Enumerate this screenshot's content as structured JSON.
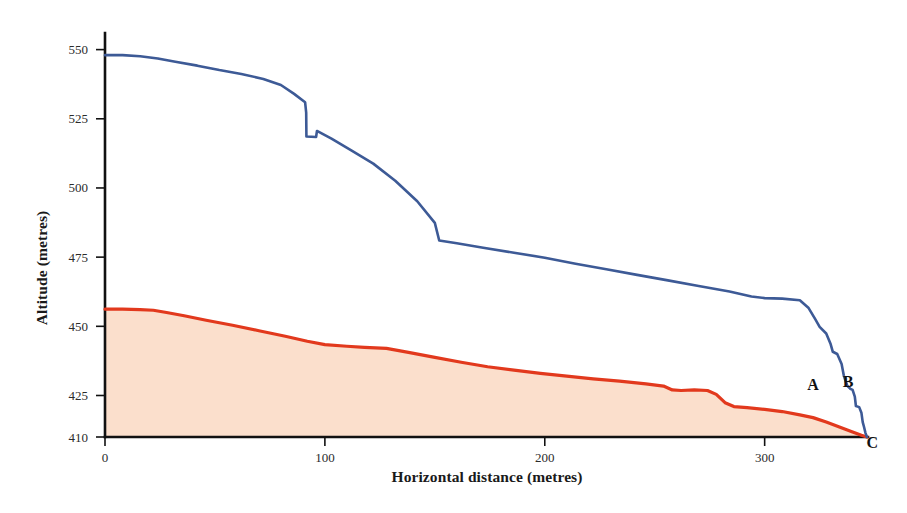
{
  "chart_data": {
    "type": "line",
    "title": "",
    "xlabel": "Horizontal distance (metres)",
    "ylabel": "Altitude (metres)",
    "xlim": [
      0,
      347
    ],
    "ylim": [
      410,
      556
    ],
    "xticks": [
      0,
      100,
      200,
      300
    ],
    "xticklabels": [
      "0",
      "100",
      "200",
      "300"
    ],
    "yticks": [
      410,
      425,
      450,
      475,
      500,
      525,
      550
    ],
    "yticklabels": [
      "410",
      "425",
      "450",
      "475",
      "500",
      "525",
      "550"
    ],
    "grid": false,
    "legend": "none",
    "series": [
      {
        "name": "upper-profile",
        "color": "#3d5a96",
        "fill": "none",
        "points": [
          [
            0,
            548.0
          ],
          [
            8,
            548.0
          ],
          [
            16,
            547.6
          ],
          [
            24,
            546.8
          ],
          [
            32,
            545.6
          ],
          [
            42,
            544.2
          ],
          [
            52,
            542.6
          ],
          [
            62,
            541.2
          ],
          [
            72,
            539.4
          ],
          [
            80,
            537.2
          ],
          [
            86,
            534.0
          ],
          [
            91,
            531.0
          ],
          [
            91.5,
            527.2
          ],
          [
            91.6,
            518.6
          ],
          [
            96,
            518.4
          ],
          [
            96.4,
            520.6
          ],
          [
            103,
            517.8
          ],
          [
            112,
            513.6
          ],
          [
            122,
            508.8
          ],
          [
            132,
            502.6
          ],
          [
            142,
            495.2
          ],
          [
            150,
            487.4
          ],
          [
            152,
            481.0
          ],
          [
            160,
            480.0
          ],
          [
            172,
            478.4
          ],
          [
            186,
            476.6
          ],
          [
            200,
            474.8
          ],
          [
            214,
            472.6
          ],
          [
            228,
            470.6
          ],
          [
            242,
            468.6
          ],
          [
            256,
            466.6
          ],
          [
            270,
            464.6
          ],
          [
            284,
            462.6
          ],
          [
            294,
            460.8
          ],
          [
            300,
            460.2
          ],
          [
            308,
            460.0
          ],
          [
            316,
            459.4
          ],
          [
            320,
            456.6
          ],
          [
            323,
            452.6
          ],
          [
            325,
            449.8
          ],
          [
            328,
            447.4
          ],
          [
            330,
            443.6
          ],
          [
            331,
            440.8
          ],
          [
            333,
            440.0
          ],
          [
            335,
            436.4
          ],
          [
            336,
            432.2
          ],
          [
            337.5,
            428.6
          ],
          [
            339,
            427.4
          ],
          [
            340,
            427.0
          ],
          [
            341,
            424.6
          ],
          [
            341.5,
            421.2
          ],
          [
            343,
            420.8
          ],
          [
            344,
            418.8
          ],
          [
            344.6,
            415.4
          ],
          [
            345.2,
            413.6
          ],
          [
            345.8,
            411.6
          ],
          [
            346.5,
            410.0
          ]
        ]
      },
      {
        "name": "lower-profile",
        "color": "#e2391d",
        "fill": "#fbdfcc",
        "points": [
          [
            0,
            456.2
          ],
          [
            8,
            456.2
          ],
          [
            16,
            456.0
          ],
          [
            22,
            455.8
          ],
          [
            28,
            455.0
          ],
          [
            36,
            453.8
          ],
          [
            46,
            452.2
          ],
          [
            58,
            450.4
          ],
          [
            70,
            448.4
          ],
          [
            82,
            446.4
          ],
          [
            92,
            444.6
          ],
          [
            100,
            443.4
          ],
          [
            110,
            442.8
          ],
          [
            118,
            442.4
          ],
          [
            128,
            442.0
          ],
          [
            138,
            440.6
          ],
          [
            150,
            438.8
          ],
          [
            162,
            437.0
          ],
          [
            174,
            435.4
          ],
          [
            186,
            434.2
          ],
          [
            198,
            433.0
          ],
          [
            210,
            432.0
          ],
          [
            222,
            431.0
          ],
          [
            234,
            430.2
          ],
          [
            246,
            429.2
          ],
          [
            254,
            428.4
          ],
          [
            258,
            427.0
          ],
          [
            262,
            426.8
          ],
          [
            268,
            427.0
          ],
          [
            274,
            426.8
          ],
          [
            278,
            425.4
          ],
          [
            282,
            422.4
          ],
          [
            286,
            421.0
          ],
          [
            292,
            420.6
          ],
          [
            300,
            420.0
          ],
          [
            308,
            419.2
          ],
          [
            316,
            418.0
          ],
          [
            322,
            417.0
          ],
          [
            328,
            415.4
          ],
          [
            334,
            413.6
          ],
          [
            340,
            411.8
          ],
          [
            344,
            410.6
          ],
          [
            346.5,
            410.0
          ]
        ]
      }
    ],
    "annotations": [
      {
        "label": "A",
        "x": 322,
        "y": 427.0
      },
      {
        "label": "B",
        "x": 338,
        "y": 428.0
      },
      {
        "label": "C",
        "x": 349,
        "y": 406.0
      }
    ]
  },
  "colors": {
    "upper_line": "#3d5a96",
    "lower_line": "#e2391d",
    "fill": "#fbdfcc",
    "axis": "#111111",
    "text": "#1a1a1a",
    "background": "#ffffff"
  }
}
